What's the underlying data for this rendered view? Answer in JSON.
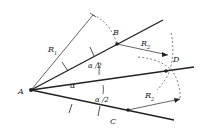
{
  "diagram": {
    "points": {
      "A": {
        "label": "A",
        "x": 31,
        "y": 90
      },
      "B": {
        "label": "B",
        "x": 117,
        "y": 44
      },
      "C": {
        "label": "C",
        "x": 128,
        "y": 110
      },
      "D": {
        "label": "D",
        "x": 166,
        "y": 71
      }
    },
    "labels": {
      "A": "A",
      "B": "B",
      "C": "C",
      "D": "D",
      "R1": "R",
      "R1_sub": "1",
      "R2_upper": "R",
      "R2_upper_sub": "2",
      "R2_lower": "R",
      "R2_lower_sub": "2",
      "alpha": "α",
      "alpha_half_upper": "α /2",
      "alpha_half_lower": "α /2"
    },
    "stroke_color": "#222222",
    "background": "#ffffff"
  }
}
